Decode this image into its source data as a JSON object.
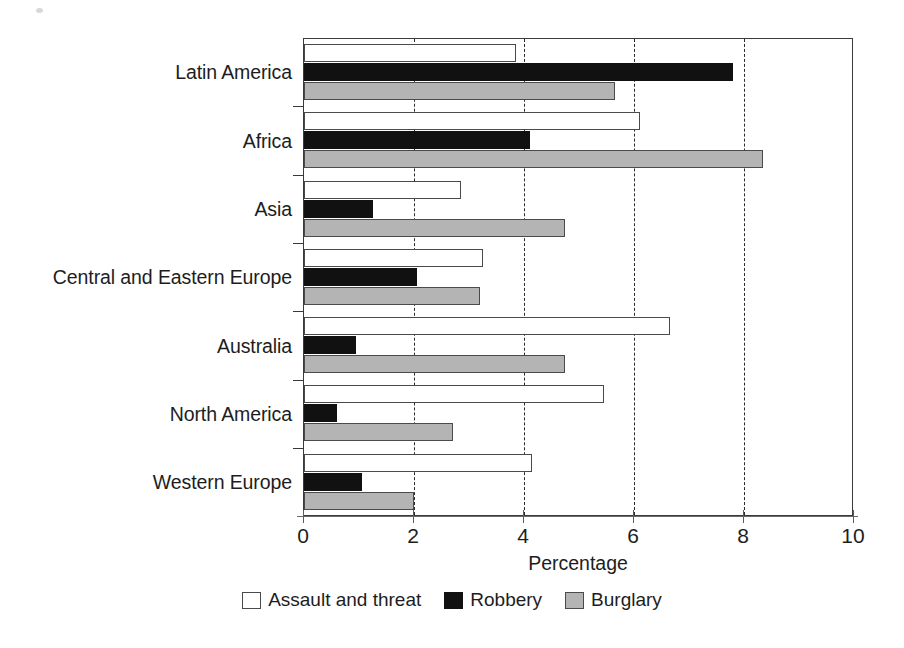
{
  "chart_data": {
    "type": "bar",
    "orientation": "horizontal",
    "title": "",
    "xlabel": "Percentage",
    "ylabel": "",
    "xlim": [
      0,
      10
    ],
    "xticks": [
      0,
      2,
      4,
      6,
      8,
      10
    ],
    "xtick_labels": [
      "0",
      "2",
      "4",
      "6",
      "8",
      "10"
    ],
    "grid": "vertical dashed gridlines at 2, 4, 6, 8",
    "legend_position": "bottom-center",
    "categories": [
      "Latin America",
      "Africa",
      "Asia",
      "Central and Eastern Europe",
      "Australia",
      "North America",
      "Western Europe"
    ],
    "series": [
      {
        "name": "Assault and threat",
        "color": "#ffffff",
        "values": [
          3.85,
          6.1,
          2.85,
          3.25,
          6.65,
          5.45,
          4.15
        ]
      },
      {
        "name": "Robbery",
        "color": "#111111",
        "values": [
          7.8,
          4.1,
          1.25,
          2.05,
          0.95,
          0.6,
          1.05
        ]
      },
      {
        "name": "Burglary",
        "color": "#b4b4b4",
        "values": [
          5.65,
          8.35,
          4.75,
          3.2,
          4.75,
          2.7,
          2.0
        ]
      }
    ]
  },
  "axis": {
    "x_title": "Percentage",
    "tick_labels": [
      "0",
      "2",
      "4",
      "6",
      "8",
      "10"
    ]
  },
  "legend": {
    "items": [
      {
        "label": "Assault and threat",
        "swatch": "white-square-swatch"
      },
      {
        "label": "Robbery",
        "swatch": "black-square-swatch"
      },
      {
        "label": "Burglary",
        "swatch": "gray-square-swatch"
      }
    ]
  },
  "categories": {
    "latin_america": "Latin America",
    "africa": "Africa",
    "asia": "Asia",
    "cee": "Central and Eastern Europe",
    "australia": "Australia",
    "north_america": "North America",
    "western_europe": "Western Europe"
  },
  "caption": {
    "sliver": ""
  }
}
